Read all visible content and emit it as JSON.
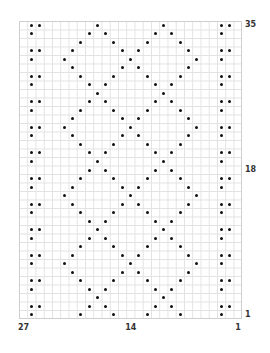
{
  "chart": {
    "columns": 27,
    "rows": 35,
    "dot_color": "#111111",
    "grid_color": "#e2e2e2",
    "border_color": "#cfcfcf",
    "row_labels": [
      {
        "text": "35",
        "row_index": 0
      },
      {
        "text": "18",
        "row_index": 17
      },
      {
        "text": "1",
        "row_index": 34
      }
    ],
    "column_labels": [
      {
        "text": "27",
        "col_index": 0
      },
      {
        "text": "14",
        "col_index": 13
      },
      {
        "text": "1",
        "col_index": 26
      }
    ],
    "dots_by_row_top_to_bottom": [
      [
        1,
        2,
        9,
        17,
        24,
        25
      ],
      [
        1,
        8,
        10,
        16,
        18,
        24
      ],
      [
        7,
        11,
        15,
        19
      ],
      [
        1,
        2,
        6,
        12,
        14,
        20,
        24,
        25
      ],
      [
        1,
        5,
        13,
        21,
        24
      ],
      [
        6,
        12,
        14,
        20
      ],
      [
        1,
        2,
        7,
        11,
        15,
        19,
        24,
        25
      ],
      [
        1,
        8,
        10,
        16,
        18,
        24
      ],
      [
        9,
        17
      ],
      [
        1,
        2,
        8,
        10,
        16,
        18,
        24,
        25
      ],
      [
        1,
        7,
        11,
        15,
        19,
        24
      ],
      [
        6,
        12,
        14,
        20
      ],
      [
        1,
        2,
        5,
        13,
        21,
        24,
        25
      ],
      [
        1,
        6,
        12,
        14,
        20,
        24
      ],
      [
        7,
        11,
        15,
        19
      ],
      [
        1,
        2,
        8,
        10,
        16,
        18,
        24,
        25
      ],
      [
        1,
        9,
        17,
        24
      ],
      [
        8,
        10,
        16,
        18
      ],
      [
        1,
        2,
        7,
        11,
        15,
        19,
        24,
        25
      ],
      [
        1,
        6,
        12,
        14,
        20,
        24
      ],
      [
        5,
        13,
        21
      ],
      [
        1,
        2,
        6,
        12,
        14,
        20,
        24,
        25
      ],
      [
        1,
        7,
        11,
        15,
        19,
        24
      ],
      [
        8,
        10,
        16,
        18
      ],
      [
        1,
        2,
        9,
        17,
        24,
        25
      ],
      [
        1,
        8,
        10,
        16,
        18,
        24
      ],
      [
        7,
        11,
        15,
        19
      ],
      [
        1,
        2,
        6,
        12,
        14,
        20,
        24,
        25
      ],
      [
        1,
        5,
        13,
        21,
        24
      ],
      [
        6,
        12,
        14,
        20
      ],
      [
        1,
        2,
        7,
        11,
        15,
        19,
        24,
        25
      ],
      [
        1,
        8,
        10,
        16,
        18,
        24
      ],
      [
        9,
        17
      ],
      [
        1,
        2,
        8,
        10,
        16,
        18,
        24,
        25
      ],
      [
        1,
        7,
        11,
        15,
        19,
        24
      ]
    ]
  },
  "chart_data": {
    "type": "table",
    "title": "",
    "xlabel": "",
    "ylabel": "",
    "x_tick_labels": [
      "27",
      "14",
      "1"
    ],
    "y_tick_labels": [
      "35",
      "18",
      "1"
    ],
    "grid": true
  }
}
